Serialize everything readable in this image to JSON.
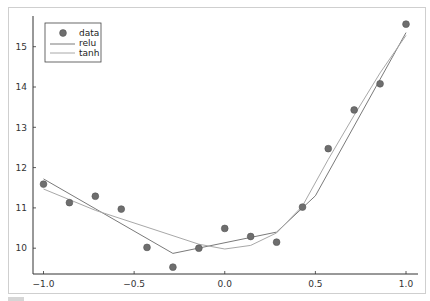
{
  "chart_data": {
    "type": "scatter",
    "title": "",
    "xlabel": "",
    "ylabel": "",
    "xlim": [
      -1.05,
      1.07
    ],
    "ylim": [
      9.35,
      15.75
    ],
    "grid": false,
    "legend_position": "top-left",
    "x_ticks": [
      -1.0,
      -0.5,
      0.0,
      0.5,
      1.0
    ],
    "x_tick_labels": [
      "−1.0",
      "−0.5",
      "0.0",
      "0.5",
      "1.0"
    ],
    "y_ticks": [
      10,
      11,
      12,
      13,
      14,
      15
    ],
    "y_tick_labels": [
      "10",
      "11",
      "12",
      "13",
      "14",
      "15"
    ],
    "series": [
      {
        "name": "data",
        "kind": "scatter",
        "color": "#6e6e6e",
        "x": [
          -1.0,
          -0.857,
          -0.714,
          -0.571,
          -0.429,
          -0.286,
          -0.143,
          0.0,
          0.143,
          0.286,
          0.429,
          0.571,
          0.714,
          0.857,
          1.0
        ],
        "y": [
          11.59,
          11.13,
          11.29,
          10.97,
          10.02,
          9.53,
          10.0,
          10.49,
          10.29,
          10.15,
          11.02,
          12.47,
          13.43,
          14.08,
          15.56
        ]
      },
      {
        "name": "relu",
        "kind": "line",
        "color": "#7a7a7a",
        "x": [
          -1.0,
          -0.286,
          0.286,
          0.5,
          1.0
        ],
        "y": [
          11.72,
          9.87,
          10.4,
          11.3,
          15.35
        ]
      },
      {
        "name": "tanh",
        "kind": "line",
        "color": "#a8a8a8",
        "x": [
          -1.0,
          -0.714,
          -0.429,
          -0.143,
          0.0,
          0.143,
          0.286,
          0.429,
          0.571,
          0.714,
          0.857,
          1.0
        ],
        "y": [
          11.47,
          10.94,
          10.52,
          10.1,
          9.98,
          10.07,
          10.38,
          11.05,
          12.2,
          13.3,
          14.35,
          15.28
        ]
      }
    ]
  },
  "legend": {
    "items": [
      {
        "label": "data"
      },
      {
        "label": "relu"
      },
      {
        "label": "tanh"
      }
    ]
  }
}
